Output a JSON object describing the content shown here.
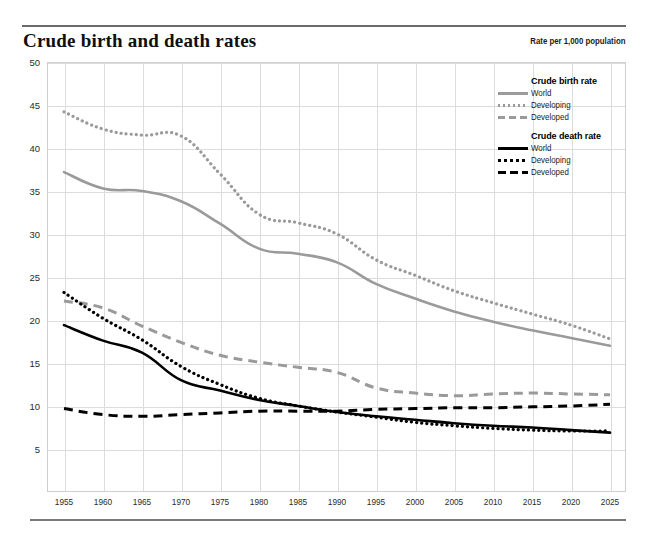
{
  "header": {
    "title": "Crude birth and death rates",
    "units_note": "Rate per 1,000 population"
  },
  "legend": {
    "groups": [
      {
        "title": "Crude birth rate",
        "items": [
          {
            "label": "World",
            "style": "solid",
            "color": "#9a9a9a"
          },
          {
            "label": "Developing",
            "style": "dotted",
            "color": "#9a9a9a"
          },
          {
            "label": "Developed",
            "style": "dashed",
            "color": "#9a9a9a"
          }
        ]
      },
      {
        "title": "Crude death rate",
        "items": [
          {
            "label": "World",
            "style": "solid",
            "color": "#000000"
          },
          {
            "label": "Developing",
            "style": "dotted",
            "color": "#000000"
          },
          {
            "label": "Developed",
            "style": "dashed",
            "color": "#000000"
          }
        ]
      }
    ]
  },
  "chart_data": {
    "type": "line",
    "title": "Crude birth and death rates",
    "subtitle": "Rate per 1,000 population",
    "xlabel": "",
    "ylabel": "",
    "ylim": [
      0,
      50
    ],
    "yticks": [
      5,
      10,
      15,
      20,
      25,
      30,
      35,
      40,
      45,
      50
    ],
    "xlim": [
      1955,
      2025
    ],
    "grid": true,
    "legend_position": "top-right",
    "x": [
      1955,
      1960,
      1965,
      1970,
      1975,
      1980,
      1985,
      1990,
      1995,
      2000,
      2005,
      2010,
      2015,
      2020,
      2025
    ],
    "series": [
      {
        "name": "Crude birth rate — World",
        "style": "solid",
        "color": "#9a9a9a",
        "values": [
          37.2,
          35.3,
          35.0,
          33.8,
          31.2,
          28.3,
          27.7,
          26.7,
          24.2,
          22.5,
          21.0,
          19.8,
          18.8,
          17.9,
          17.0
        ]
      },
      {
        "name": "Crude birth rate — Developing",
        "style": "dotted",
        "color": "#9a9a9a",
        "values": [
          44.2,
          42.2,
          41.5,
          41.4,
          37.0,
          32.3,
          31.3,
          30.0,
          27.0,
          25.2,
          23.4,
          22.0,
          20.7,
          19.4,
          17.8
        ]
      },
      {
        "name": "Crude birth rate — Developed",
        "style": "dashed",
        "color": "#9a9a9a",
        "values": [
          22.2,
          21.4,
          19.3,
          17.4,
          15.9,
          15.1,
          14.5,
          13.9,
          12.1,
          11.5,
          11.2,
          11.4,
          11.5,
          11.4,
          11.3
        ]
      },
      {
        "name": "Crude death rate — World",
        "style": "solid",
        "color": "#000000",
        "values": [
          19.4,
          17.6,
          16.2,
          13.0,
          11.8,
          10.7,
          10.0,
          9.3,
          8.8,
          8.4,
          8.0,
          7.7,
          7.5,
          7.2,
          6.9
        ]
      },
      {
        "name": "Crude death rate — Developing",
        "style": "dotted",
        "color": "#000000",
        "values": [
          23.2,
          20.2,
          17.7,
          14.6,
          12.5,
          10.9,
          10.0,
          9.3,
          8.7,
          8.1,
          7.7,
          7.4,
          7.2,
          7.1,
          7.1
        ]
      },
      {
        "name": "Crude death rate — Developed",
        "style": "dashed",
        "color": "#000000",
        "values": [
          9.7,
          9.0,
          8.8,
          9.0,
          9.2,
          9.4,
          9.4,
          9.4,
          9.6,
          9.7,
          9.8,
          9.8,
          9.9,
          10.0,
          10.2
        ]
      }
    ]
  },
  "axes": {
    "y_tick_labels": [
      "50",
      "45",
      "40",
      "35",
      "30",
      "25",
      "20",
      "15",
      "10",
      "5"
    ],
    "x_tick_labels": [
      "1955",
      "1960",
      "1965",
      "1970",
      "1975",
      "1980",
      "1985",
      "1990",
      "1995",
      "2000",
      "2005",
      "2010",
      "2015",
      "2020",
      "2025"
    ]
  }
}
